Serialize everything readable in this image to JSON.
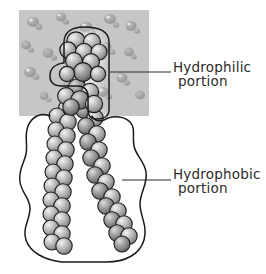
{
  "figure": {
    "type": "scientific-illustration",
    "style": "grayscale hand-annotated textbook diagram",
    "background_color": "#ffffff"
  },
  "water_phase": {
    "name": "water-region",
    "fill_color": "#c6c6c6",
    "bounds": {
      "x": 19,
      "y": 10,
      "width": 130,
      "height": 106
    },
    "droplet_color": "#9a9a9a"
  },
  "molecule": {
    "head": {
      "name": "hydrophilic-head-group",
      "sphere_fill": "#b9b9b9",
      "sphere_stroke": "#1a1a1a"
    },
    "tails": {
      "name": "hydrophobic-tails",
      "count": 2,
      "sphere_fill": "#b0b0b0",
      "sphere_stroke": "#1a1a1a"
    }
  },
  "outlines": {
    "hydrophilic": {
      "name": "hydrophilic-outline",
      "stroke_color": "#1a1a1a"
    },
    "hydrophobic": {
      "name": "hydrophobic-outline",
      "stroke_color": "#1a1a1a"
    }
  },
  "annotations": [
    {
      "id": "hydrophilic",
      "line1": "Hydrophilic",
      "line2": "portion",
      "leader": {
        "x1": 110,
        "y1": 72,
        "x2": 171,
        "y2": 72
      },
      "color": "#2b2b2b"
    },
    {
      "id": "hydrophobic",
      "line1": "Hydrophobic",
      "line2": "portion",
      "leader": {
        "x1": 122,
        "y1": 180,
        "x2": 171,
        "y2": 180
      },
      "color": "#2b2b2b"
    }
  ]
}
